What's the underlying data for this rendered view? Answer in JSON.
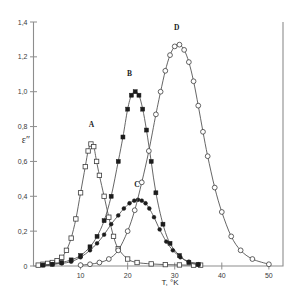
{
  "chart_data": {
    "type": "line",
    "title": "",
    "xlabel": "T, °K",
    "ylabel": "ε″",
    "xlim": [
      0,
      53
    ],
    "ylim": [
      0,
      1.4
    ],
    "grid": false,
    "legend": "inline-curve-labels",
    "xticks": [
      10,
      20,
      30,
      40,
      50
    ],
    "xtick_labels": [
      "10",
      "20",
      "30",
      "40",
      "50"
    ],
    "yticks": [
      0,
      0.2,
      0.4,
      0.6,
      0.8,
      1.0,
      1.2,
      1.4
    ],
    "ytick_labels": [
      "0",
      "0,2",
      "0,4",
      "0,6",
      "0,8",
      "1,0",
      "1,2",
      "1,4"
    ],
    "series": [
      {
        "name": "A",
        "label": "A",
        "marker": "open-square",
        "label_x": 12.3,
        "label_y": 0.8,
        "x": [
          1.0,
          2.0,
          3.0,
          4.0,
          5.0,
          6.0,
          7.0,
          8.0,
          9.0,
          10.0,
          11.0,
          11.6,
          12.2,
          12.8,
          13.4,
          14.0,
          15.0,
          16.0,
          17.0,
          18.0,
          20.0,
          22.0,
          25.0,
          28.0,
          31.0,
          34.0,
          35.5
        ],
        "y": [
          0.005,
          0.01,
          0.015,
          0.02,
          0.03,
          0.05,
          0.09,
          0.16,
          0.27,
          0.42,
          0.57,
          0.66,
          0.7,
          0.685,
          0.6,
          0.52,
          0.4,
          0.28,
          0.17,
          0.1,
          0.04,
          0.02,
          0.012,
          0.008,
          0.006,
          0.005,
          0.005
        ]
      },
      {
        "name": "B",
        "label": "B",
        "marker": "filled-square",
        "label_x": 20.4,
        "label_y": 1.09,
        "x": [
          2.0,
          4.0,
          6.0,
          8.0,
          10.0,
          12.0,
          13.5,
          15.0,
          16.5,
          18.0,
          19.0,
          20.0,
          20.8,
          21.6,
          22.4,
          23.2,
          24.0,
          25.0,
          26.0,
          27.5,
          29.0,
          31.0,
          33.0,
          35.0
        ],
        "y": [
          0.005,
          0.01,
          0.02,
          0.035,
          0.06,
          0.11,
          0.17,
          0.26,
          0.4,
          0.6,
          0.74,
          0.9,
          0.98,
          1.0,
          0.98,
          0.9,
          0.78,
          0.6,
          0.42,
          0.24,
          0.13,
          0.06,
          0.02,
          0.008
        ]
      },
      {
        "name": "C",
        "label": "C",
        "marker": "filled-circle",
        "label_x": 22.0,
        "label_y": 0.455,
        "x": [
          2.0,
          4.0,
          6.0,
          8.0,
          10.0,
          12.0,
          13.5,
          15.0,
          16.5,
          18.0,
          19.2,
          20.4,
          21.4,
          22.2,
          23.0,
          23.8,
          24.6,
          25.6,
          26.8,
          28.2,
          29.6,
          31.2,
          33.0,
          35.0
        ],
        "y": [
          0.005,
          0.01,
          0.015,
          0.025,
          0.05,
          0.09,
          0.13,
          0.18,
          0.24,
          0.29,
          0.33,
          0.36,
          0.375,
          0.38,
          0.375,
          0.36,
          0.33,
          0.28,
          0.21,
          0.14,
          0.09,
          0.05,
          0.025,
          0.01
        ]
      },
      {
        "name": "D",
        "label": "D",
        "marker": "open-circle",
        "label_x": 30.4,
        "label_y": 1.355,
        "x": [
          10.0,
          12.0,
          14.0,
          16.0,
          18.0,
          20.0,
          21.5,
          23.0,
          24.5,
          26.0,
          27.0,
          28.0,
          29.0,
          30.0,
          31.0,
          32.0,
          33.0,
          34.0,
          35.0,
          36.0,
          37.0,
          38.5,
          40.0,
          42.0,
          44.0,
          46.5,
          50.0
        ],
        "y": [
          0.005,
          0.01,
          0.02,
          0.04,
          0.09,
          0.2,
          0.32,
          0.48,
          0.66,
          0.87,
          1.0,
          1.12,
          1.21,
          1.26,
          1.27,
          1.24,
          1.17,
          1.06,
          0.92,
          0.77,
          0.63,
          0.45,
          0.31,
          0.17,
          0.09,
          0.04,
          0.01
        ]
      }
    ]
  }
}
